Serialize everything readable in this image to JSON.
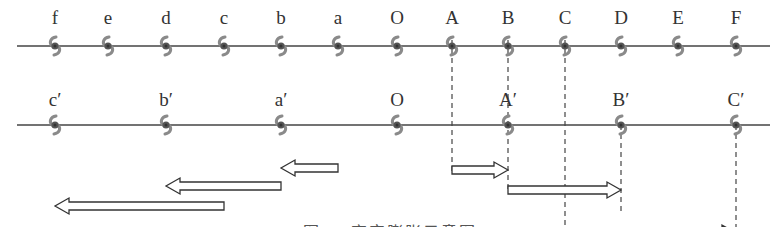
{
  "figure": {
    "caption_partial": "图 … 宇宙膨胀示意图 (caption cut off at bottom edge)",
    "colors": {
      "line": "#444444",
      "galaxy": "#8a8a8a",
      "galaxy_core": "#555555",
      "arrow": "#333333",
      "dash": "#444444"
    }
  },
  "rows": {
    "top": {
      "y": 46,
      "label_y": 8,
      "x_start": 17,
      "x_end": 770,
      "points": [
        {
          "label": "f",
          "x": 55
        },
        {
          "label": "e",
          "x": 108
        },
        {
          "label": "d",
          "x": 166
        },
        {
          "label": "c",
          "x": 224
        },
        {
          "label": "b",
          "x": 281
        },
        {
          "label": "a",
          "x": 338
        },
        {
          "label": "O",
          "x": 397
        },
        {
          "label": "A",
          "x": 452
        },
        {
          "label": "B",
          "x": 508
        },
        {
          "label": "C",
          "x": 565
        },
        {
          "label": "D",
          "x": 621
        },
        {
          "label": "E",
          "x": 678
        },
        {
          "label": "F",
          "x": 736
        }
      ]
    },
    "bottom": {
      "y": 125,
      "label_y": 90,
      "x_start": 17,
      "x_end": 770,
      "points": [
        {
          "label": "c′",
          "x": 55
        },
        {
          "label": "b′",
          "x": 166
        },
        {
          "label": "a′",
          "x": 281
        },
        {
          "label": "O",
          "x": 397
        },
        {
          "label": "A′",
          "x": 508
        },
        {
          "label": "B′",
          "x": 621
        },
        {
          "label": "C′",
          "x": 736
        }
      ]
    }
  },
  "dashed_lines": [
    {
      "x": 452,
      "y1": 40,
      "y2": 172
    },
    {
      "x": 508,
      "y1": 40,
      "y2": 192
    },
    {
      "x": 565,
      "y1": 40,
      "y2": 233
    },
    {
      "x": 621,
      "y1": 125,
      "y2": 212
    },
    {
      "x": 736,
      "y1": 125,
      "y2": 235
    }
  ],
  "arrows_right": [
    {
      "from": 452,
      "to": 508,
      "y": 170
    },
    {
      "from": 508,
      "to": 621,
      "y": 190
    },
    {
      "from": 565,
      "to": 736,
      "y": 233
    }
  ],
  "arrows_left": [
    {
      "from": 338,
      "to": 281,
      "y": 168
    },
    {
      "from": 281,
      "to": 166,
      "y": 186
    },
    {
      "from": 224,
      "to": 55,
      "y": 206
    }
  ]
}
